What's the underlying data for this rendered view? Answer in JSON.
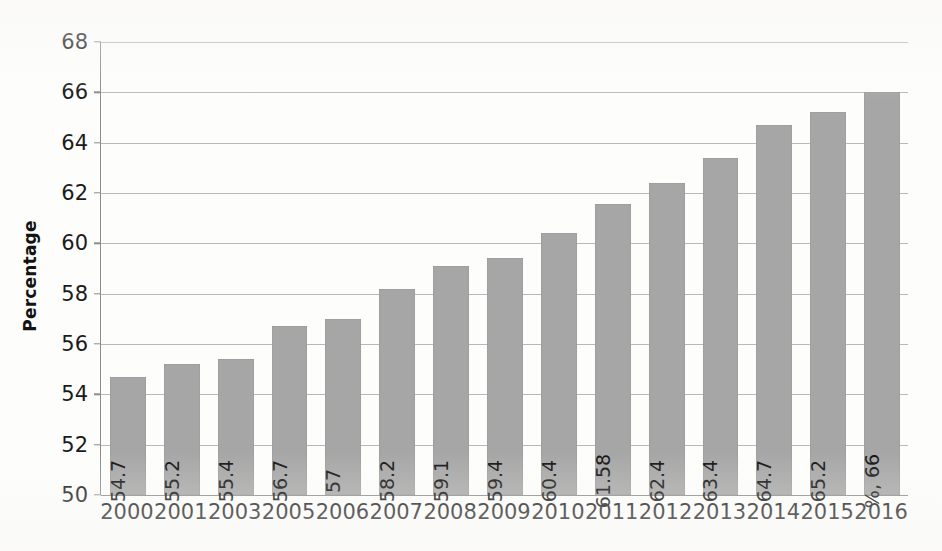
{
  "chart_data": {
    "type": "bar",
    "title": "",
    "subtitle": "",
    "xlabel": "",
    "ylabel": "Percentage",
    "ylim": [
      50,
      68
    ],
    "ytick_step": 2,
    "yticks": [
      50,
      52,
      54,
      56,
      58,
      60,
      62,
      64,
      66,
      68
    ],
    "grid": true,
    "legend": false,
    "legend_position": "none",
    "orientation": "vertical",
    "bar_color": "#a6a6a6",
    "gridline_color": "#b9b9b9",
    "axis_color": "#8c8c8c",
    "background_color": "#fdfdfc",
    "label_orientation": "rotated-90-ccw",
    "label_position": "inside-bottom",
    "categories": [
      "2000",
      "2001",
      "2003",
      "2005",
      "2006",
      "2007",
      "2008",
      "2009",
      "2010",
      "2011",
      "2012",
      "2013",
      "2014",
      "2015",
      "2016"
    ],
    "values": [
      54.7,
      55.2,
      55.4,
      56.7,
      57,
      58.2,
      59.1,
      59.4,
      60.4,
      61.58,
      62.4,
      63.4,
      64.7,
      65.2,
      66
    ],
    "data_labels": [
      "54.7",
      "55.2",
      "55.4",
      "56.7",
      "57",
      "58.2",
      "59.1",
      "59.4",
      "60.4",
      "61.58",
      "62.4",
      "63.4",
      "64.7",
      "65.2",
      "%, 66"
    ]
  },
  "axes": {
    "y_title": "Percentage"
  }
}
